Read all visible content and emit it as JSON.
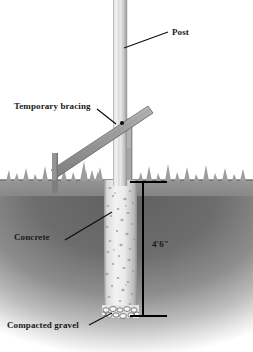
{
  "diagram": {
    "labels": {
      "post": "Post",
      "bracing": "Temporary bracing",
      "concrete": "Concrete",
      "gravel": "Compacted gravel",
      "depth": "4'6\""
    }
  },
  "colors": {
    "background": "#ffffff",
    "post_light": "#e4e4e4",
    "post_mid": "#cfcfcf",
    "post_edge": "#a8a8a8",
    "brace_fill": "#9a9a9a",
    "brace_edge": "#6f6f6f",
    "stake_fill": "#8e8e8e",
    "soil_dark": "#6e6e6e",
    "soil_mid": "#8c8c8c",
    "grass": "#9e9e9e",
    "concrete_fill": "#e9e9e9",
    "concrete_speck": "#9b9b9b",
    "gravel_fill": "#f2f2f2",
    "gravel_edge": "#5a5a5a",
    "leader_line": "#111111",
    "dimension_line": "#000000",
    "text": "#1a1a1a"
  },
  "geometry": {
    "ground_line_y": 180,
    "footing_bottom_y": 316,
    "post_x_left": 113,
    "post_x_right": 127,
    "pier_x_left": 104,
    "pier_x_right": 137,
    "dimension_x": 143
  }
}
